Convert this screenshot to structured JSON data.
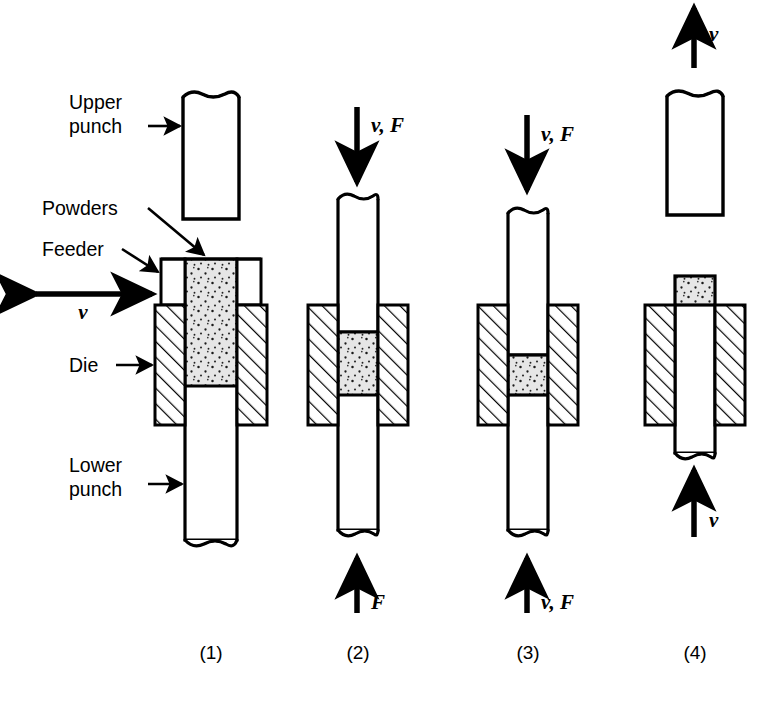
{
  "figure": {
    "background_color": "#ffffff",
    "line_color": "#000000",
    "powder_fill_color": "#e3e3e3",
    "hatch_color": "#000000"
  },
  "callouts": [
    {
      "id": "upper-punch",
      "line1": "Upper",
      "line2": "punch"
    },
    {
      "id": "powders",
      "line1": "Powders",
      "line2": ""
    },
    {
      "id": "feeder",
      "line1": "Feeder",
      "line2": ""
    },
    {
      "id": "die",
      "line1": "Die",
      "line2": ""
    },
    {
      "id": "lower-punch",
      "line1": "Lower",
      "line2": "punch"
    }
  ],
  "motion_symbols": {
    "feeder_v": "v",
    "stage2_top": "v, F",
    "stage2_bottom": "F",
    "stage3_top": "v, F",
    "stage3_bottom": "v, F",
    "stage4_top": "v",
    "stage4_bottom": "v"
  },
  "steps": [
    {
      "id": "step-1",
      "label": "(1)",
      "caption": "Powders fed into die cavity by feeder"
    },
    {
      "id": "step-2",
      "label": "(2)",
      "caption": "Upper punch descends, pressure applied"
    },
    {
      "id": "step-3",
      "label": "(3)",
      "caption": "Both punches compress powder to final density"
    },
    {
      "id": "step-4",
      "label": "(4)",
      "caption": "Upper punch withdraws, lower punch ejects compact"
    }
  ]
}
